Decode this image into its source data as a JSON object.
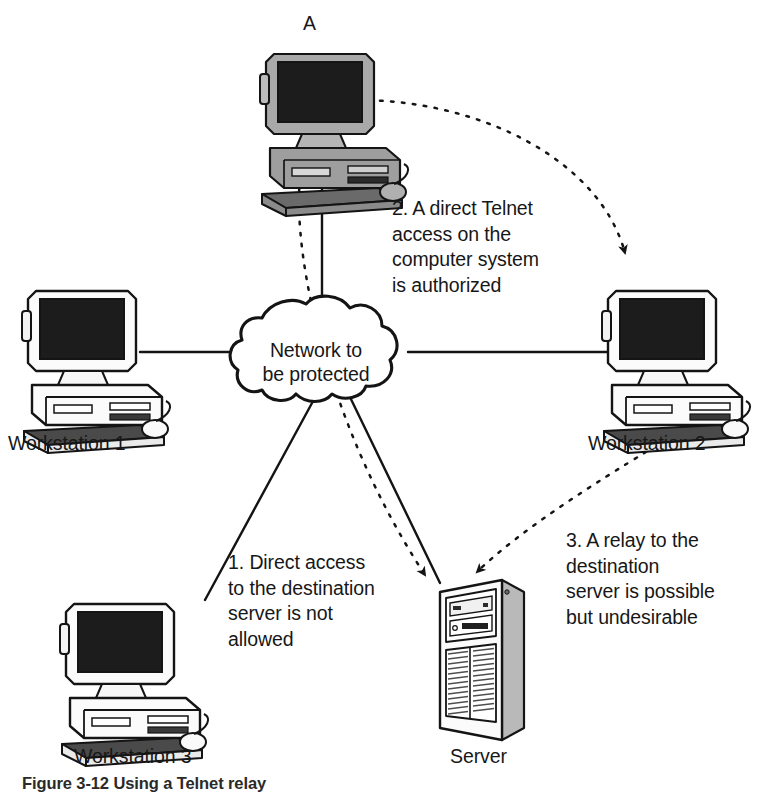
{
  "figure": {
    "type": "network-security-diagram",
    "caption": "Figure 3-12  Using a Telnet relay"
  },
  "cloud": {
    "label": "Network to\nbe protected"
  },
  "nodes": [
    {
      "id": "a",
      "label": "A",
      "kind": "desktop-computer-shaded"
    },
    {
      "id": "ws1",
      "label": "Workstation 1",
      "kind": "desktop-computer"
    },
    {
      "id": "ws2",
      "label": "Workstation 2",
      "kind": "desktop-computer"
    },
    {
      "id": "ws3",
      "label": "Workstation 3",
      "kind": "desktop-computer"
    },
    {
      "id": "srv",
      "label": "Server",
      "kind": "tower-server"
    }
  ],
  "annotations": [
    {
      "id": "n1",
      "text": "1. Direct access\nto the destination\nserver is not\nallowed"
    },
    {
      "id": "n2",
      "text": "2. A direct Telnet\naccess on the\ncomputer system\nis authorized"
    },
    {
      "id": "n3",
      "text": "3. A relay to the\ndestination\nserver is possible\nbut undesirable"
    }
  ],
  "links": [
    {
      "from": "a",
      "to": "cloud",
      "style": "solid"
    },
    {
      "from": "ws1",
      "to": "cloud",
      "style": "solid"
    },
    {
      "from": "ws2",
      "to": "cloud",
      "style": "solid"
    },
    {
      "from": "ws3",
      "to": "cloud",
      "style": "solid"
    },
    {
      "from": "srv",
      "to": "cloud",
      "style": "solid"
    },
    {
      "from": "a",
      "to": "ws2",
      "style": "dashed",
      "arrow": true
    },
    {
      "from": "a",
      "to": "srv",
      "style": "dashed",
      "arrow": true
    },
    {
      "from": "ws2",
      "to": "srv",
      "style": "dashed",
      "arrow": true
    }
  ],
  "colors": {
    "ink": "#1a1a1a",
    "paper": "#ffffff",
    "screen": "#1c1c1c",
    "shade": "#8d8d8d",
    "case": "#f4f4f4"
  }
}
